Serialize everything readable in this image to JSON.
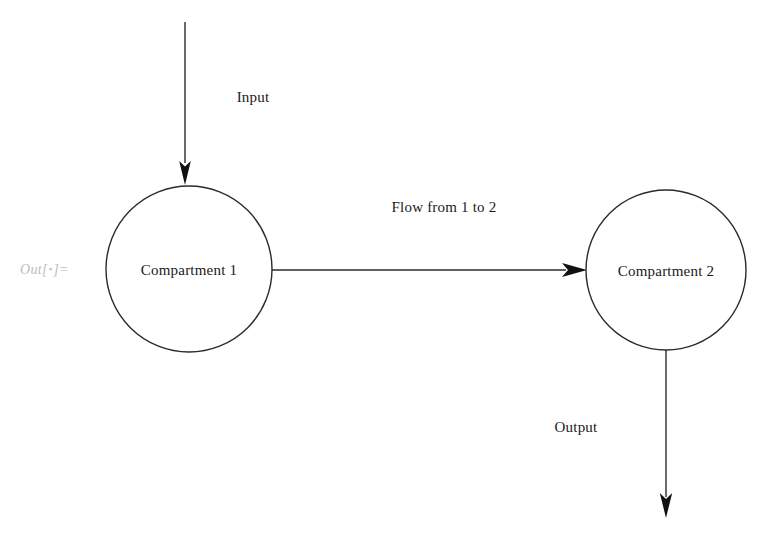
{
  "diagram": {
    "background_color": "#ffffff",
    "stroke_color": "#1a1a1a",
    "prompt": {
      "prefix": "Out[",
      "placeholder": "▪",
      "suffix": "]=",
      "color": "#bdbdbd"
    },
    "nodes": [
      {
        "id": "compartment-1",
        "label": "Compartment 1",
        "cx": 189,
        "cy": 269,
        "r": 83
      },
      {
        "id": "compartment-2",
        "label": "Compartment 2",
        "cx": 666,
        "cy": 270,
        "r": 80
      }
    ],
    "edges": [
      {
        "id": "input",
        "label": "Input",
        "label_x": 253,
        "label_y": 97,
        "direction": "down",
        "from_x": 185,
        "from_y": 22,
        "to_x": 185,
        "to_y": 184
      },
      {
        "id": "flow-1-to-2",
        "label": "Flow from 1 to 2",
        "label_x": 444,
        "label_y": 207,
        "direction": "right",
        "from_x": 272,
        "from_y": 270,
        "to_x": 587,
        "to_y": 270
      },
      {
        "id": "output",
        "label": "Output",
        "label_x": 576,
        "label_y": 427,
        "direction": "down",
        "from_x": 666,
        "from_y": 350,
        "to_x": 666,
        "to_y": 518
      }
    ]
  }
}
